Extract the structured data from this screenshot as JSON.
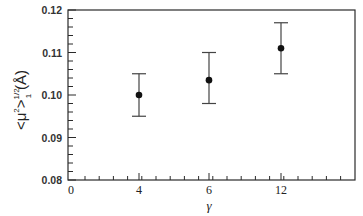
{
  "chart_data": {
    "type": "scatter",
    "title": "",
    "xlabel": "γ",
    "ylabel": "<μ²>₁^(1/2) (Å)",
    "ylabel_parts": {
      "main": "<μ",
      "sup1": "2",
      "close": ">",
      "sup2": "1/2",
      "sub": "1",
      "unit": "(Å)"
    },
    "categories": [
      "0",
      "4",
      "6",
      "12"
    ],
    "x_tick_labels": [
      "0",
      "4",
      "6",
      "12"
    ],
    "y_tick_labels": [
      "0.08",
      "0.09",
      "0.10",
      "0.11",
      "0.12"
    ],
    "ylim": [
      0.08,
      0.12
    ],
    "grid": false,
    "legend": null,
    "series": [
      {
        "name": "<μ²>₁^(1/2)",
        "x": [
          "4",
          "6",
          "12"
        ],
        "values": [
          0.1,
          0.1035,
          0.111
        ],
        "error_upper": [
          0.105,
          0.11,
          0.117
        ],
        "error_lower": [
          0.095,
          0.098,
          0.105
        ]
      }
    ]
  },
  "colors": {
    "frame": "#2a2a2a",
    "marker": "#111111",
    "errorbar": "#444444",
    "background": "#ffffff"
  }
}
